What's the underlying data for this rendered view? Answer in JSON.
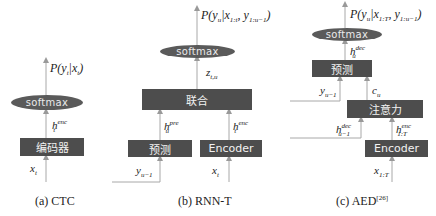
{
  "panels": [
    {
      "id": "ctc",
      "caption": "(a)  CTC",
      "output_label": "P(y_t|x_t)",
      "softmax_label": "softmax",
      "hidden_label": "h_t^enc",
      "encoder_label": "编码器",
      "input_label": "x_t"
    },
    {
      "id": "rnnt",
      "caption": "(b)  RNN-T",
      "output_label": "P(y_u|x_{1:t}, y_{1:u-1})",
      "softmax_label": "softmax",
      "joint_output_label": "z_{t,u}",
      "joint_label": "联合",
      "pred_hidden_label": "h_u^pre",
      "enc_hidden_label": "h_t^enc",
      "predictor_label": "预测",
      "encoder_label": "Encoder",
      "pred_input_label": "y_{u-1}",
      "enc_input_label": "x_t"
    },
    {
      "id": "aed",
      "caption": "(c) AED",
      "caption_ref": "[26]",
      "output_label": "P(y_u|x_{1:T}, y_{1:u-1})",
      "softmax_label": "softmax",
      "dec_hidden_label": "h_u^dec",
      "predictor_label": "预测",
      "pred_input_label": "y_{u-1}",
      "context_label": "c_u",
      "attention_label": "注意力",
      "prev_dec_hidden_label": "h_{u-1}^dec",
      "enc_hidden_label": "h_{1:T}^enc",
      "encoder_label": "Encoder",
      "input_label": "x_{1:T}"
    }
  ],
  "colors": {
    "box": "#4d4d4d",
    "softmax": "#5a5a5a",
    "line": "#999999",
    "text": "#222222"
  }
}
